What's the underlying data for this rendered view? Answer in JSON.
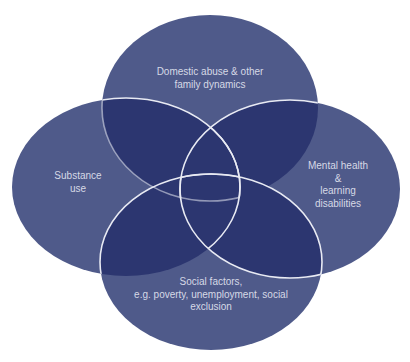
{
  "diagram": {
    "type": "venn",
    "colors": {
      "background": "#ffffff",
      "circle_fill": "#4f5a8a",
      "overlap_fill": "#2c3670",
      "outline": "#e8eaf3",
      "text": "#d6d9e6"
    },
    "circles": [
      {
        "id": "domestic",
        "lines": [
          "Domestic abuse & other",
          "family dynamics"
        ]
      },
      {
        "id": "substance",
        "lines": [
          "Substance",
          "use"
        ]
      },
      {
        "id": "mental",
        "lines": [
          "Mental health",
          "&",
          "learning",
          "disabilities"
        ]
      },
      {
        "id": "social",
        "lines": [
          "Social factors,",
          "e.g. poverty, unemployment, social",
          "exclusion"
        ]
      }
    ]
  }
}
